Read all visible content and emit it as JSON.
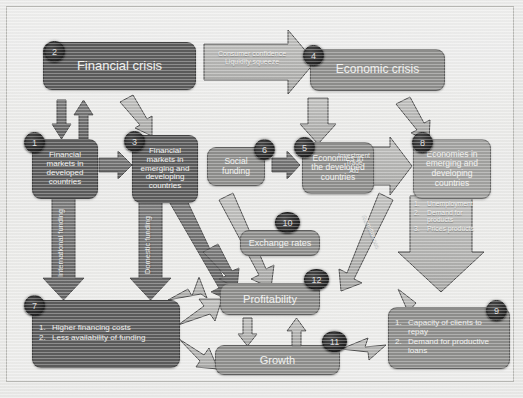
{
  "diagram": {
    "colors": {
      "background": "#e9e9e7",
      "box_dark": "#5b5b5b",
      "box_mid": "#8e8e8c",
      "box_light": "#a2a2a0",
      "arrow_dark": "#6f6f6f",
      "arrow_light": "#b5b5b3",
      "badge": "#262626",
      "text": "#f2f2f0"
    }
  },
  "nodes": {
    "n1": {
      "badge": "1",
      "label": "Financial markets in developed countries"
    },
    "n2": {
      "badge": "2",
      "label": "Financial crisis"
    },
    "n3": {
      "badge": "3",
      "label": "Financial markets in emerging and developing countries"
    },
    "n4": {
      "badge": "4",
      "label": "Economic crisis"
    },
    "n5": {
      "badge": "5",
      "label": "Economies in the developed countries"
    },
    "n6": {
      "badge": "6",
      "label": "Social funding"
    },
    "n7": {
      "badge": "7",
      "items": [
        {
          "n": "1.",
          "t": "Higher financing costs"
        },
        {
          "n": "2.",
          "t": "Less availability of funding"
        }
      ]
    },
    "n8": {
      "badge": "8",
      "label": "Economies in emerging and developing countries"
    },
    "n9": {
      "badge": "9",
      "items": [
        {
          "n": "1.",
          "t": "Capacity of clients to repay"
        },
        {
          "n": "2.",
          "t": "Demand for productive loans"
        }
      ]
    },
    "n10": {
      "badge": "10",
      "label": "Exchange rates"
    },
    "n11": {
      "badge": "11",
      "label": "Growth"
    },
    "n12": {
      "badge": "12",
      "label": "Profitability"
    }
  },
  "arrow_labels": {
    "crisis_link_line1": "Consumer confidence",
    "crisis_link_line2": "Liquidity squeeze",
    "international_funding": "International funding",
    "domestic_funding": "Domestic funding",
    "investment_line1": "Investment",
    "investment_line2": "Trade",
    "investment_line3": "Aid",
    "remittances": "Remittances"
  },
  "effects_arrow": {
    "items": [
      {
        "n": "1.",
        "t": "Unemployment"
      },
      {
        "n": "2.",
        "t": "Demand for products"
      },
      {
        "n": "3.",
        "t": "Prices products"
      }
    ]
  }
}
